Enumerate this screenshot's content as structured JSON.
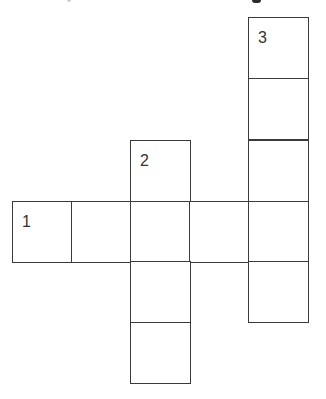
{
  "puzzle": {
    "type": "crossword-grid",
    "line_color": "#3a3a3a",
    "background": "#ffffff",
    "clues_visible": false,
    "entries": [
      {
        "number": "1",
        "direction": "across",
        "length": 5
      },
      {
        "number": "2",
        "direction": "down",
        "length": 4
      },
      {
        "number": "3",
        "direction": "down",
        "length": 5
      }
    ],
    "cells": [
      {
        "id": "c3-1",
        "x": 248,
        "y": 17,
        "number": "3"
      },
      {
        "id": "c3-2",
        "x": 248,
        "y": 78,
        "number": ""
      },
      {
        "id": "c3-3",
        "x": 248,
        "y": 140,
        "number": ""
      },
      {
        "id": "c2-1",
        "x": 130,
        "y": 140,
        "number": "2"
      },
      {
        "id": "c1-1",
        "x": 12,
        "y": 201,
        "number": "1"
      },
      {
        "id": "c1-2",
        "x": 71,
        "y": 201,
        "number": ""
      },
      {
        "id": "c1-3",
        "x": 130,
        "y": 201,
        "number": ""
      },
      {
        "id": "c1-4",
        "x": 189,
        "y": 201,
        "number": ""
      },
      {
        "id": "c1-5",
        "x": 248,
        "y": 201,
        "number": ""
      },
      {
        "id": "c2-3",
        "x": 130,
        "y": 261,
        "number": ""
      },
      {
        "id": "c3-5",
        "x": 248,
        "y": 261,
        "number": ""
      },
      {
        "id": "c2-4",
        "x": 130,
        "y": 322,
        "number": ""
      }
    ]
  }
}
